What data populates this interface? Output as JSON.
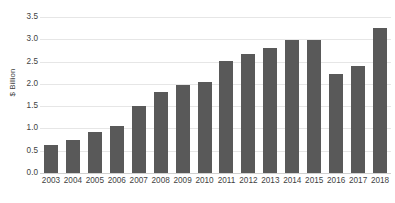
{
  "chart_data": {
    "type": "bar",
    "title": "",
    "subtitle": "",
    "xlabel": "",
    "ylabel": "$ Billion",
    "categories": [
      "2003",
      "2004",
      "2005",
      "2006",
      "2007",
      "2008",
      "2009",
      "2010",
      "2011",
      "2012",
      "2013",
      "2014",
      "2015",
      "2016",
      "2017",
      "2018"
    ],
    "values": [
      0.62,
      0.75,
      0.92,
      1.05,
      1.5,
      1.82,
      1.97,
      2.05,
      2.52,
      2.68,
      2.8,
      2.98,
      2.98,
      2.22,
      2.4,
      3.25
    ],
    "ylim": [
      0.0,
      3.5
    ],
    "ytick_step": 0.5,
    "ytick_labels": [
      "0.0",
      "0.5",
      "1.0",
      "1.5",
      "2.0",
      "2.5",
      "3.0",
      "3.5"
    ],
    "grid": true,
    "grid_axis": "y",
    "legend": false,
    "legend_position": "none",
    "bar_color": "#595959",
    "grid_color": "#e6e6e6",
    "text_color": "#3f3f3f",
    "background_color": "#ffffff"
  },
  "axes": {
    "y_title": "$ Billion",
    "y_ticks": [
      "3.5",
      "3.0",
      "2.5",
      "2.0",
      "1.5",
      "1.0",
      "0.5",
      "0.0"
    ],
    "x_ticks": [
      "2003",
      "2004",
      "2005",
      "2006",
      "2007",
      "2008",
      "2009",
      "2010",
      "2011",
      "2012",
      "2013",
      "2014",
      "2015",
      "2016",
      "2017",
      "2018"
    ]
  },
  "header": {
    "title_fragment": ""
  }
}
